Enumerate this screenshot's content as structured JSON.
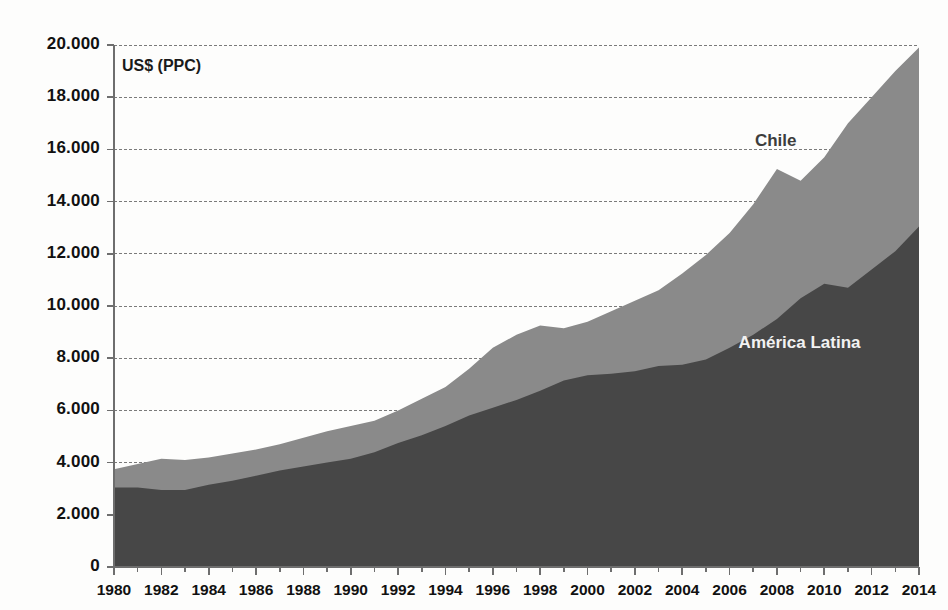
{
  "axis": {
    "unit_label": "US$ (PPC)",
    "y_ticks": [
      "0",
      "2.000",
      "4.000",
      "6.000",
      "8.000",
      "10.000",
      "12.000",
      "14.000",
      "16.000",
      "18.000",
      "20.000"
    ],
    "x_ticks": [
      "1980",
      "1982",
      "1984",
      "1986",
      "1988",
      "1990",
      "1992",
      "1994",
      "1996",
      "1998",
      "2000",
      "2002",
      "2004",
      "2006",
      "2008",
      "2010",
      "2012",
      "2014"
    ]
  },
  "labels": {
    "chile": "Chile",
    "america_latina": "América Latina"
  },
  "colors": {
    "chile_fill": "#8a8a8a",
    "america_latina_fill": "#474747",
    "axis": "#6e6e6e",
    "gridline": "#7a7a7a",
    "background": "#fdfdfc"
  },
  "chart_data": {
    "type": "area",
    "title": "",
    "subtitle": "",
    "xlabel": "",
    "ylabel": "US$ (PPC)",
    "xlim": [
      1980,
      2014
    ],
    "ylim": [
      0,
      20000
    ],
    "grid": true,
    "legend_position": "inline-annotations",
    "stacked": false,
    "y_tick_step": 2000,
    "x_tick_step": 2,
    "x_minor_tick_step": 1,
    "x": [
      1980,
      1981,
      1982,
      1983,
      1984,
      1985,
      1986,
      1987,
      1988,
      1989,
      1990,
      1991,
      1992,
      1993,
      1994,
      1995,
      1996,
      1997,
      1998,
      1999,
      2000,
      2001,
      2002,
      2003,
      2004,
      2005,
      2006,
      2007,
      2008,
      2009,
      2010,
      2011,
      2012,
      2013,
      2014
    ],
    "series": [
      {
        "name": "Chile",
        "color": "#8a8a8a",
        "values": [
          3750,
          3950,
          4150,
          4100,
          4200,
          4350,
          4500,
          4700,
          4950,
          5200,
          5400,
          5600,
          6000,
          6450,
          6900,
          7600,
          8400,
          8900,
          9250,
          9150,
          9400,
          9800,
          10200,
          10600,
          11250,
          11950,
          12800,
          13900,
          15250,
          14800,
          15700,
          17000,
          18000,
          19000,
          19900
        ]
      },
      {
        "name": "América Latina",
        "color": "#474747",
        "values": [
          3050,
          3050,
          2950,
          2950,
          3150,
          3300,
          3500,
          3700,
          3850,
          4000,
          4150,
          4400,
          4750,
          5050,
          5400,
          5800,
          6100,
          6400,
          6750,
          7150,
          7350,
          7400,
          7500,
          7700,
          7750,
          7950,
          8400,
          8900,
          9500,
          10300,
          10850,
          10700,
          11400,
          12100,
          13050
        ]
      }
    ],
    "annotations": [
      {
        "text": "Chile",
        "x": 2008,
        "y": 16300,
        "color": "#3d3d3d"
      },
      {
        "text": "América Latina",
        "x": 2009,
        "y": 8550,
        "color": "#f2f2f2"
      }
    ]
  }
}
